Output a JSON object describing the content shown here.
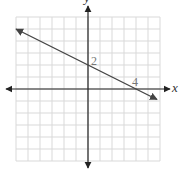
{
  "chart_data": {
    "type": "line",
    "title": "",
    "xlabel": "x",
    "ylabel": "y",
    "xlim": [
      -6,
      6
    ],
    "ylim": [
      -6,
      6
    ],
    "grid": true,
    "grid_step": 1,
    "legend": null,
    "series": [
      {
        "name": "line",
        "equation": "y = -0.5x + 2",
        "slope": -0.5,
        "intercept": 2,
        "x": [
          -6,
          0,
          4,
          5.75
        ],
        "y": [
          5,
          2,
          0,
          -0.875
        ]
      }
    ],
    "annotations": [
      {
        "text": "2",
        "x": 0,
        "y": 2,
        "meaning": "y-intercept"
      },
      {
        "text": "4",
        "x": 4,
        "y": 0,
        "meaning": "x-intercept"
      }
    ]
  },
  "labels": {
    "x_axis": "x",
    "y_axis": "y",
    "y_intercept": "2",
    "x_intercept": "4"
  },
  "colors": {
    "grid": "#d9d9d9",
    "axis": "#222222",
    "line": "#444444",
    "label": "#777777"
  }
}
